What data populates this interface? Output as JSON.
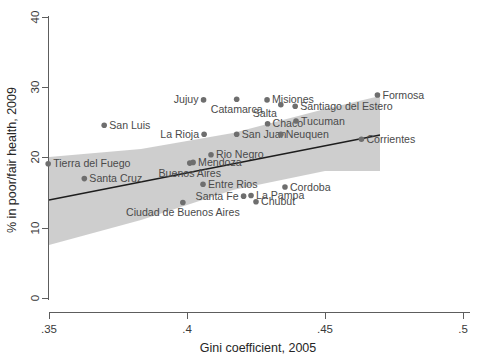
{
  "chart_data": {
    "type": "scatter",
    "title": "",
    "xlabel": "Gini coefficient, 2005",
    "ylabel": "% in poor/fair health, 2009",
    "xlim": [
      0.35,
      0.5
    ],
    "ylim": [
      0,
      40
    ],
    "xticks": [
      ".35",
      ".4",
      ".45",
      ".5"
    ],
    "xtick_values": [
      0.35,
      0.4,
      0.45,
      0.5
    ],
    "yticks": [
      "0",
      "10",
      "20",
      "30",
      "40"
    ],
    "ytick_values": [
      0,
      10,
      20,
      30,
      40
    ],
    "grid": false,
    "legend": "none",
    "marker_color": "#6e6e6e",
    "fit_line_color": "#1d1d1d",
    "ci_band_color": "#c6c6c6",
    "points": [
      {
        "label": "Tierra del Fuego",
        "x": 0.3497,
        "y": 19.1,
        "label_pos": "right"
      },
      {
        "label": "Santa Cruz",
        "x": 0.3628,
        "y": 17.0,
        "label_pos": "right"
      },
      {
        "label": "San Luis",
        "x": 0.37,
        "y": 24.6,
        "label_pos": "right"
      },
      {
        "label": "Ciudad de Buenos Aires",
        "x": 0.3985,
        "y": 13.6,
        "label_pos": "below"
      },
      {
        "label": "Buenos Aires",
        "x": 0.401,
        "y": 19.2,
        "label_pos": "below"
      },
      {
        "label": "Mendoza",
        "x": 0.4022,
        "y": 19.3,
        "label_pos": "right"
      },
      {
        "label": "Entre Rios",
        "x": 0.4058,
        "y": 16.2,
        "label_pos": "right"
      },
      {
        "label": "Jujuy",
        "x": 0.406,
        "y": 28.2,
        "label_pos": "left"
      },
      {
        "label": "La Rioja",
        "x": 0.4062,
        "y": 23.3,
        "label_pos": "left"
      },
      {
        "label": "Rio Negro",
        "x": 0.4087,
        "y": 20.4,
        "label_pos": "right"
      },
      {
        "label": "Catamarca",
        "x": 0.418,
        "y": 28.3,
        "label_pos": "below"
      },
      {
        "label": "San Juan",
        "x": 0.418,
        "y": 23.3,
        "label_pos": "right"
      },
      {
        "label": "Santa Fe",
        "x": 0.4205,
        "y": 14.5,
        "label_pos": "left"
      },
      {
        "label": "La Pampa",
        "x": 0.4232,
        "y": 14.6,
        "label_pos": "right"
      },
      {
        "label": "Chubut",
        "x": 0.425,
        "y": 13.7,
        "label_pos": "right"
      },
      {
        "label": "Misiones",
        "x": 0.429,
        "y": 28.2,
        "label_pos": "right"
      },
      {
        "label": "Chaco",
        "x": 0.4292,
        "y": 24.8,
        "label_pos": "right"
      },
      {
        "label": "Salta",
        "x": 0.434,
        "y": 27.5,
        "label_pos": "left-below"
      },
      {
        "label": "Neuquen",
        "x": 0.434,
        "y": 23.3,
        "label_pos": "right"
      },
      {
        "label": "Cordoba",
        "x": 0.4355,
        "y": 15.8,
        "label_pos": "right"
      },
      {
        "label": "Santiago del Estero",
        "x": 0.4392,
        "y": 27.3,
        "label_pos": "right"
      },
      {
        "label": "Tucuman",
        "x": 0.4395,
        "y": 25.2,
        "label_pos": "right"
      },
      {
        "label": "Corrientes",
        "x": 0.4632,
        "y": 22.6,
        "label_pos": "right"
      },
      {
        "label": "Formosa",
        "x": 0.469,
        "y": 28.9,
        "label_pos": "right"
      }
    ],
    "fit_line": {
      "x0": 0.35,
      "y0": 14.0,
      "x1": 0.4695,
      "y1": 23.2
    },
    "ci_band": {
      "x0": 0.35,
      "x1": 0.4695,
      "upper": [
        20.1,
        21.2,
        23.5,
        26.9,
        28.8
      ],
      "lower": [
        7.5,
        11.1,
        15.4,
        18.1,
        18.0
      ]
    }
  }
}
